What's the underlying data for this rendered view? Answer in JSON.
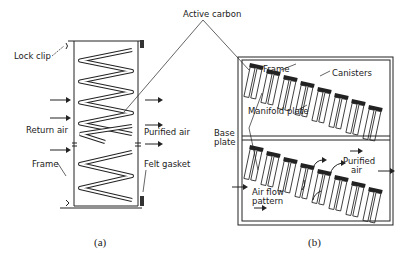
{
  "labels": {
    "active_carbon": "Active carbon",
    "lock_clip": "Lock clip",
    "return_air": "Return air",
    "purified_air_a": "Purified air",
    "frame_a": "Frame",
    "felt_gasket": "Felt gasket",
    "frame_b": "Frame",
    "canisters": "Canisters",
    "manifold_plate": "Manifold plate",
    "base_plate_1": "Base",
    "base_plate_2": "plate",
    "purified_air_b1": "Purified",
    "purified_air_b2": "air",
    "air_flow_1": "Air flow",
    "air_flow_2": "pattern"
  },
  "captions": {
    "a": "(a)",
    "b": "(b)"
  }
}
